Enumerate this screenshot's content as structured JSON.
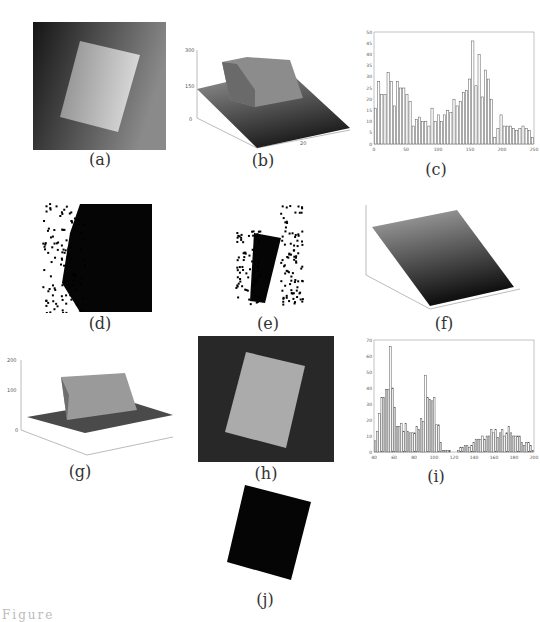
{
  "figure": {
    "captions": {
      "a": "(a)",
      "b": "(b)",
      "c": "(c)",
      "d": "(d)",
      "e": "(e)",
      "f": "(f)",
      "g": "(g)",
      "h": "(h)",
      "i": "(i)",
      "j": "(j)"
    },
    "footer_text": "Figure"
  },
  "chart_data": [
    {
      "id": "b",
      "type": "surface3d",
      "title": "",
      "zlim": [
        0,
        300
      ],
      "z_ticks": [
        "0",
        "50",
        "100",
        "150",
        "200",
        "250",
        "300"
      ],
      "x_ticks": [
        "0",
        "5",
        "10",
        "15",
        "20",
        "25",
        "30"
      ],
      "y_ticks": [
        "0",
        "10",
        "20",
        "30"
      ],
      "description": "Intensity surface of image (a): sloped background with raised plateau (~250) for the rectangle"
    },
    {
      "id": "c",
      "type": "bar",
      "title": "Histogram of image (a)",
      "xlim": [
        0,
        256
      ],
      "ylim": [
        0,
        50
      ],
      "x_ticks": [
        "0",
        "50",
        "100",
        "150",
        "200",
        "250"
      ],
      "y_ticks": [
        "0",
        "5",
        "10",
        "15",
        "20",
        "25",
        "30",
        "35",
        "40",
        "45",
        "50"
      ],
      "categories": [
        0,
        5,
        10,
        15,
        20,
        25,
        30,
        35,
        40,
        45,
        50,
        55,
        60,
        65,
        70,
        75,
        80,
        85,
        90,
        95,
        100,
        105,
        110,
        115,
        120,
        125,
        130,
        135,
        140,
        145,
        150,
        155,
        160,
        165,
        170,
        175,
        180,
        185,
        190,
        195,
        200,
        205,
        210,
        215,
        220,
        225,
        230,
        235,
        240,
        245,
        250
      ],
      "values": [
        16,
        28,
        22,
        22,
        32,
        28,
        17,
        28,
        25,
        25,
        22,
        19,
        8,
        11,
        12,
        10,
        10,
        8,
        16,
        10,
        13,
        10,
        13,
        15,
        14,
        20,
        17,
        19,
        23,
        24,
        29,
        46,
        26,
        40,
        21,
        33,
        29,
        20,
        3,
        7,
        13,
        8,
        8,
        8,
        7,
        6,
        7,
        8,
        7,
        6,
        3
      ]
    },
    {
      "id": "f",
      "type": "surface3d",
      "title": "",
      "zlim": [
        0,
        200
      ],
      "z_ticks": [
        "0",
        "50",
        "100",
        "150",
        "200"
      ],
      "x_ticks": [
        "0",
        "5",
        "10",
        "15",
        "20",
        "25",
        "30"
      ],
      "y_ticks": [
        "0",
        "10",
        "20",
        "30"
      ],
      "description": "Fitted planar background surface"
    },
    {
      "id": "g",
      "type": "surface3d",
      "title": "",
      "zlim": [
        0,
        200
      ],
      "z_ticks": [
        "0",
        "50",
        "100",
        "150",
        "200"
      ],
      "x_ticks": [
        "0",
        "5",
        "10",
        "15",
        "20",
        "25",
        "30"
      ],
      "y_ticks": [
        "0",
        "10",
        "20",
        "30"
      ],
      "description": "Background-corrected surface: flat base ~50 with plateau ~150"
    },
    {
      "id": "i",
      "type": "bar",
      "title": "Histogram of corrected image (h)",
      "xlim": [
        40,
        200
      ],
      "ylim": [
        0,
        70
      ],
      "x_ticks": [
        "40",
        "60",
        "80",
        "100",
        "120",
        "140",
        "160",
        "180",
        "200"
      ],
      "y_ticks": [
        "0",
        "10",
        "20",
        "30",
        "40",
        "50",
        "60",
        "70"
      ],
      "categories": [
        40,
        42,
        44,
        46,
        48,
        50,
        52,
        54,
        56,
        58,
        60,
        62,
        64,
        66,
        68,
        70,
        72,
        74,
        76,
        78,
        80,
        82,
        84,
        86,
        88,
        90,
        92,
        94,
        96,
        98,
        100,
        102,
        104,
        106,
        108,
        110,
        112,
        114,
        116,
        118,
        120,
        122,
        124,
        126,
        128,
        130,
        132,
        134,
        136,
        138,
        140,
        142,
        144,
        146,
        148,
        150,
        152,
        154,
        156,
        158,
        160,
        162,
        164,
        166,
        168,
        170,
        172,
        174,
        176,
        178,
        180,
        182,
        184
      ],
      "values": [
        7,
        13,
        24,
        34,
        34,
        39,
        39,
        66,
        40,
        28,
        16,
        16,
        18,
        13,
        18,
        13,
        12,
        12,
        12,
        16,
        14,
        21,
        19,
        48,
        34,
        33,
        32,
        34,
        17,
        17,
        6,
        1,
        1,
        1,
        1,
        0,
        0,
        0,
        1,
        3,
        3,
        4,
        4,
        3,
        4,
        6,
        8,
        8,
        8,
        10,
        8,
        10,
        10,
        14,
        12,
        14,
        9,
        12,
        14,
        10,
        12,
        16,
        12,
        10,
        10,
        10,
        10,
        6,
        4,
        6,
        6,
        4,
        1
      ]
    }
  ]
}
